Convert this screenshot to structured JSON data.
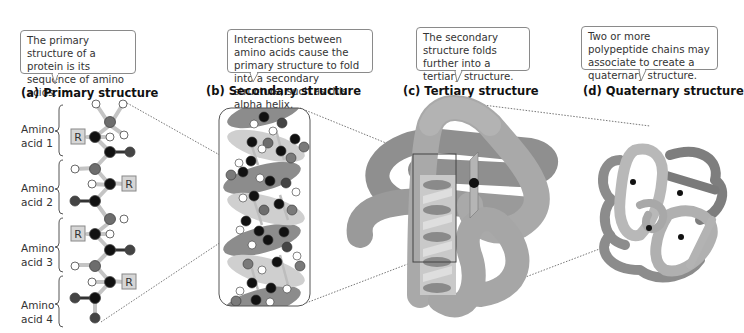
{
  "panels": [
    {
      "id": "a",
      "title": "(a)  Primary structure",
      "callout": "The primary structure of a protein is its sequence of amino acids."
    },
    {
      "id": "b",
      "title": "(b)  Secondary structure",
      "callout": "Interactions between amino acids cause the primary structure to fold into a secondary structure, such as this alpha helix."
    },
    {
      "id": "c",
      "title": "(c)  Tertiary structure",
      "callout": "The secondary structure folds further into a tertiary structure."
    },
    {
      "id": "d",
      "title": "(d)  Quaternary structure",
      "callout": "Two or more polypeptide chains may associate to create a quaternary structure."
    }
  ],
  "amino_acids": [
    {
      "line1": "Amino",
      "line2": "acid 1",
      "r_label": "R"
    },
    {
      "line1": "Amino",
      "line2": "acid 2",
      "r_label": "R"
    },
    {
      "line1": "Amino",
      "line2": "acid 3",
      "r_label": "R"
    },
    {
      "line1": "Amino",
      "line2": "acid 4",
      "r_label": "R"
    }
  ],
  "colors": {
    "atom_black": "#111111",
    "atom_dark_gray": "#555555",
    "atom_mid_gray": "#7a7a7a",
    "atom_white": "#ffffff",
    "bond": "#bdbdbd",
    "helix_light": "#cfcfcf",
    "helix_dark": "#8c8c8c",
    "ribbon": "#a6a6a6",
    "ribbon_light": "#c2c2c2",
    "ribbon_dark": "#8a8a8a",
    "callout_border": "#8a8a8a",
    "dotted_line": "#666666"
  }
}
